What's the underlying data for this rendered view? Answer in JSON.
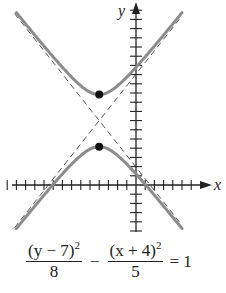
{
  "figure": {
    "type": "hyperbola-graph",
    "axes": {
      "x_label": "x",
      "y_label": "y"
    },
    "equation": {
      "term1_numerator": "(y − 7)",
      "term1_exponent": "2",
      "term1_denominator": "8",
      "operator": "−",
      "term2_numerator": "(x + 4)",
      "term2_exponent": "2",
      "term2_denominator": "5",
      "equals": "= 1"
    },
    "center": [
      -4,
      7
    ],
    "vertices": [
      [
        -4,
        9.83
      ],
      [
        -4,
        4.17
      ]
    ],
    "asymptote_slopes": [
      1.265,
      -1.265
    ],
    "x_ticks": {
      "min": -14,
      "max": 6,
      "step": 1
    },
    "y_ticks": {
      "min": -5,
      "max": 19,
      "step": 1
    },
    "colors": {
      "curve": "#8c8c8c",
      "asymptote": "#555555",
      "axis": "#222222",
      "vertex": "#111111"
    }
  }
}
